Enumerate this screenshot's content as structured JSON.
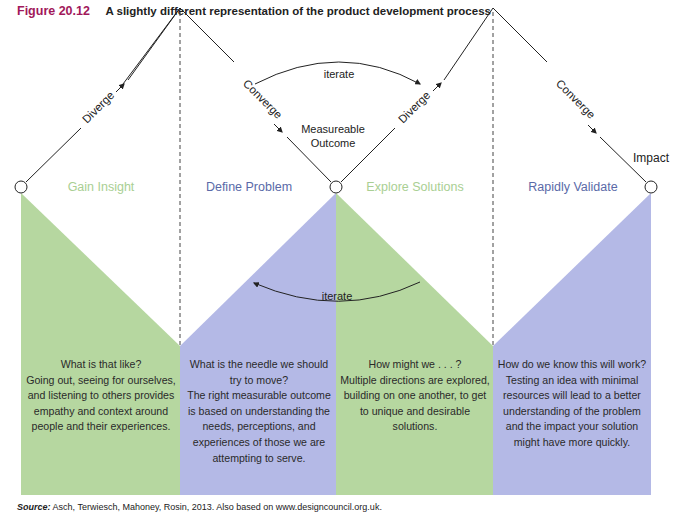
{
  "figure": {
    "number": "Figure 20.12",
    "caption": "A slightly different representation of the product development process"
  },
  "colors": {
    "green": "#b6d7a0",
    "blue": "#b4b9e6",
    "title_accent": "#a1185a",
    "green_label": "#a9cf93",
    "blue_label": "#5a6aa8"
  },
  "diagram": {
    "arrows": {
      "diverge_1": "Diverge",
      "converge_1": "Converge",
      "diverge_2": "Diverge",
      "converge_2": "Converge",
      "iterate_top": "iterate",
      "iterate_bottom": "iterate"
    },
    "milestones": {
      "measureable_outcome_line1": "Measureable",
      "measureable_outcome_line2": "Outcome",
      "impact": "Impact"
    },
    "phases": [
      {
        "name": "Gain Insight",
        "color": "green",
        "question": "What is that like?",
        "description": "Going out, seeing for ourselves, and listening to others provides empathy and context around people and their experiences."
      },
      {
        "name": "Define Problem",
        "color": "blue",
        "question": "What is the needle we should try to move?",
        "description": "The right measurable outcome is based on understanding the needs, perceptions, and experiences of those we are attempting to serve."
      },
      {
        "name": "Explore Solutions",
        "color": "green",
        "question": "How might we . . . ?",
        "description": "Multiple directions are explored, building on one another, to get to unique and desirable solutions."
      },
      {
        "name": "Rapidly Validate",
        "color": "blue",
        "question": "How do we know this will work?",
        "description": "Testing an idea with minimal resources will lead to a better understanding of the problem and the impact your solution might have more quickly."
      }
    ]
  },
  "source": {
    "label": "Source:",
    "text": "Asch, Terwiesch, Mahoney, Rosin, 2013. Also based on www.designcouncil.org.uk."
  }
}
